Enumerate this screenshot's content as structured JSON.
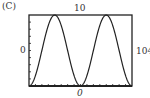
{
  "panel_label": "(C)",
  "chart_data": {
    "type": "line",
    "title": "",
    "xlabel": "",
    "ylabel": "",
    "xlim": [
      0,
      104
    ],
    "ylim": [
      0,
      10
    ],
    "tick_labels": {
      "x_min": "0",
      "x_max": "104",
      "y_min": "0",
      "y_max": "10"
    },
    "grid": false,
    "series": [
      {
        "name": "curve",
        "x": [
          0,
          6.5,
          13,
          19.5,
          26,
          32.5,
          39,
          45.5,
          52,
          58.5,
          65,
          71.5,
          78,
          84.5,
          91,
          97.5,
          104
        ],
        "y": [
          0,
          1.46,
          5,
          8.54,
          10,
          8.54,
          5,
          1.46,
          0,
          1.46,
          5,
          8.54,
          10,
          8.54,
          5,
          1.46,
          0
        ]
      }
    ],
    "x_ticks_count": 16,
    "y_ticks_count": 10
  }
}
